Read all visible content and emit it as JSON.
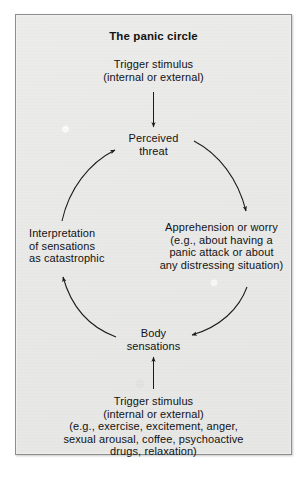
{
  "figure": {
    "title": "The panic circle",
    "background_color": "#e9e9e8",
    "border_color": "#8e8e8e",
    "text_color": "#111111"
  },
  "nodes": {
    "trigger_top": "Trigger stimulus\n(internal or external)",
    "perceived_threat": "Perceived\nthreat",
    "apprehension": "Apprehension or worry\n(e.g., about having a\npanic attack or about\nany distressing situation)",
    "interpretation": "Interpretation\nof sensations\nas catastrophic",
    "body_sensations": "Body\nsensations",
    "trigger_bottom": "Trigger stimulus\n(internal or external)\n(e.g., exercise, excitement, anger,\nsexual arousal, coffee, psychoactive\ndrugs, relaxation)"
  },
  "arrows": [
    {
      "name": "trigger-top-to-perceived-threat",
      "from": "trigger_top",
      "to": "perceived_threat",
      "style": "straight-vertical",
      "direction": "down"
    },
    {
      "name": "perceived-threat-to-apprehension",
      "from": "perceived_threat",
      "to": "apprehension",
      "style": "curved-arc",
      "direction": "clockwise"
    },
    {
      "name": "apprehension-to-body-sensations",
      "from": "apprehension",
      "to": "body_sensations",
      "style": "curved-arc",
      "direction": "clockwise"
    },
    {
      "name": "body-sensations-to-interpretation",
      "from": "body_sensations",
      "to": "interpretation",
      "style": "curved-arc",
      "direction": "clockwise"
    },
    {
      "name": "interpretation-to-perceived-threat",
      "from": "interpretation",
      "to": "perceived_threat",
      "style": "curved-arc",
      "direction": "clockwise"
    },
    {
      "name": "trigger-bottom-to-body-sensations",
      "from": "trigger_bottom",
      "to": "body_sensations",
      "style": "straight-vertical",
      "direction": "up"
    }
  ]
}
